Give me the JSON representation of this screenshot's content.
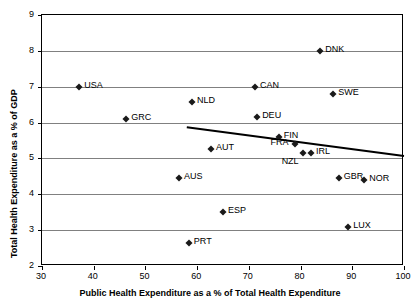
{
  "chart_data": {
    "type": "scatter",
    "title": "",
    "xlabel": "Public Health Expenditure as a % of Total Health Expenditure",
    "ylabel": "Total Health Expenditure as a % of GDP",
    "xlim": [
      30,
      100
    ],
    "ylim": [
      2,
      9
    ],
    "xticks": [
      30,
      40,
      50,
      60,
      70,
      80,
      90,
      100
    ],
    "yticks": [
      2,
      3,
      4,
      5,
      6,
      7,
      8,
      9
    ],
    "grid": "horizontal",
    "legend": "none",
    "marker": "black-diamond",
    "points": [
      {
        "label": "USA",
        "x": 37.2,
        "y": 7.0,
        "label_side": "right"
      },
      {
        "label": "GRC",
        "x": 46.3,
        "y": 6.1,
        "label_side": "right"
      },
      {
        "label": "AUS",
        "x": 56.5,
        "y": 4.45,
        "label_side": "right"
      },
      {
        "label": "PRT",
        "x": 58.4,
        "y": 2.65,
        "label_side": "right"
      },
      {
        "label": "NLD",
        "x": 59.0,
        "y": 6.57,
        "label_side": "right"
      },
      {
        "label": "AUT",
        "x": 62.7,
        "y": 5.25,
        "label_side": "right"
      },
      {
        "label": "ESP",
        "x": 65.0,
        "y": 3.5,
        "label_side": "right"
      },
      {
        "label": "CAN",
        "x": 71.2,
        "y": 7.0,
        "label_side": "right"
      },
      {
        "label": "DEU",
        "x": 71.6,
        "y": 6.15,
        "label_side": "right"
      },
      {
        "label": "FIN",
        "x": 75.8,
        "y": 5.6,
        "label_side": "right"
      },
      {
        "label": "FRA",
        "x": 79.0,
        "y": 5.4,
        "label_side": "left"
      },
      {
        "label": "NZL",
        "x": 80.4,
        "y": 5.15,
        "label_side": "below-left"
      },
      {
        "label": "IRL",
        "x": 82.0,
        "y": 5.15,
        "label_side": "right"
      },
      {
        "label": "DNK",
        "x": 83.8,
        "y": 8.0,
        "label_side": "right"
      },
      {
        "label": "SWE",
        "x": 86.3,
        "y": 6.8,
        "label_side": "right"
      },
      {
        "label": "GBR",
        "x": 87.4,
        "y": 4.45,
        "label_side": "right"
      },
      {
        "label": "LUX",
        "x": 89.2,
        "y": 3.1,
        "label_side": "right"
      },
      {
        "label": "NOR",
        "x": 92.3,
        "y": 4.4,
        "label_side": "right"
      }
    ],
    "trendline": {
      "x0": 58.0,
      "y0": 5.87,
      "x1": 100.0,
      "y1": 5.07
    }
  }
}
